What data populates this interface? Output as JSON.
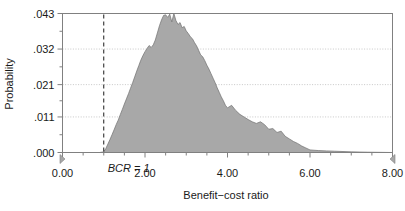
{
  "chart_data": {
    "type": "area",
    "title": "",
    "xlabel": "Benefit−cost ratio",
    "ylabel": "Probability",
    "xlim": [
      0.0,
      8.0
    ],
    "ylim": [
      0.0,
      0.043
    ],
    "grid": true,
    "grid_axis": "y",
    "legend": "none",
    "x_ticks": [
      0.0,
      2.0,
      4.0,
      6.0,
      8.0
    ],
    "x_tick_labels": [
      "0.00",
      "2.00",
      "4.00",
      "6.00",
      "8.00"
    ],
    "y_ticks": [
      0.0,
      0.011,
      0.021,
      0.032,
      0.043
    ],
    "y_tick_labels": [
      ".000",
      ".011",
      ".021",
      ".032",
      ".043"
    ],
    "fill_color": "#a8a8a8",
    "line_color": "#707070",
    "axis_color": "#808080",
    "grid_color": "#b0b0b0",
    "annotations": [
      {
        "name": "bcr-threshold",
        "label": "BCR = 1",
        "x": 1.0,
        "style": "dashed-vertical-line",
        "color": "#1a1a1a"
      }
    ],
    "range_markers": [
      {
        "name": "lower-bound-marker",
        "x": 0.0,
        "direction": "right",
        "color": "#a8a8a8"
      },
      {
        "name": "upper-bound-marker",
        "x": 8.0,
        "direction": "left",
        "color": "#a8a8a8"
      }
    ],
    "x": [
      0.0,
      0.1,
      0.2,
      0.3,
      0.4,
      0.5,
      0.6,
      0.7,
      0.8,
      0.9,
      1.0,
      1.05,
      1.1,
      1.15,
      1.2,
      1.25,
      1.3,
      1.35,
      1.4,
      1.45,
      1.5,
      1.55,
      1.6,
      1.65,
      1.7,
      1.75,
      1.8,
      1.85,
      1.9,
      1.95,
      2.0,
      2.05,
      2.1,
      2.15,
      2.2,
      2.25,
      2.3,
      2.35,
      2.4,
      2.45,
      2.5,
      2.55,
      2.6,
      2.65,
      2.7,
      2.75,
      2.8,
      2.85,
      2.9,
      2.95,
      3.0,
      3.05,
      3.1,
      3.15,
      3.2,
      3.25,
      3.3,
      3.35,
      3.4,
      3.45,
      3.5,
      3.55,
      3.6,
      3.65,
      3.7,
      3.75,
      3.8,
      3.85,
      3.9,
      3.95,
      4.0,
      4.1,
      4.2,
      4.3,
      4.4,
      4.5,
      4.6,
      4.7,
      4.8,
      4.9,
      5.0,
      5.1,
      5.2,
      5.3,
      5.4,
      5.5,
      5.6,
      5.7,
      5.8,
      5.9,
      6.0,
      6.2,
      6.4,
      6.6,
      6.8,
      7.0,
      7.4,
      8.0
    ],
    "y": [
      0.0,
      0.0,
      0.0,
      0.0,
      0.0,
      0.0,
      0.0,
      0.0,
      0.0,
      0.0,
      0.0002,
      0.0012,
      0.0026,
      0.004,
      0.0055,
      0.007,
      0.0086,
      0.01,
      0.0117,
      0.0133,
      0.015,
      0.0166,
      0.0182,
      0.0199,
      0.0216,
      0.0234,
      0.0252,
      0.0269,
      0.0286,
      0.03,
      0.0312,
      0.0322,
      0.0331,
      0.0325,
      0.0333,
      0.0348,
      0.037,
      0.0392,
      0.041,
      0.0424,
      0.0426,
      0.0418,
      0.0428,
      0.0404,
      0.043,
      0.0408,
      0.0396,
      0.0402,
      0.0386,
      0.039,
      0.0376,
      0.0368,
      0.0358,
      0.0352,
      0.034,
      0.033,
      0.0316,
      0.0302,
      0.0296,
      0.0284,
      0.027,
      0.0258,
      0.0244,
      0.023,
      0.0216,
      0.02,
      0.0186,
      0.0172,
      0.016,
      0.0146,
      0.0138,
      0.0146,
      0.013,
      0.0118,
      0.011,
      0.0102,
      0.0095,
      0.009,
      0.0095,
      0.0086,
      0.0072,
      0.0074,
      0.0062,
      0.0066,
      0.005,
      0.0042,
      0.0034,
      0.0028,
      0.002,
      0.0014,
      0.0008,
      0.0006,
      0.0005,
      0.0004,
      0.0003,
      0.0002,
      0.0001,
      0.0
    ]
  }
}
